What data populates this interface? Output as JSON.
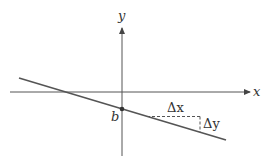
{
  "diagram": {
    "axes": {
      "x_label": "x",
      "y_label": "y"
    },
    "line": {
      "description": "line with negative slope crossing y-axis at b"
    },
    "intercept_label": "b",
    "delta_x_label": "Δx",
    "delta_y_label": "Δy",
    "colors": {
      "stroke": "#555555",
      "text": "#333333"
    }
  }
}
